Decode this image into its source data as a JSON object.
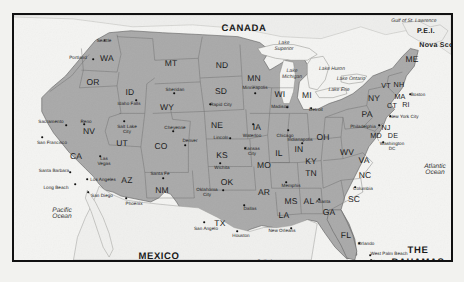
{
  "figure": {
    "frame_color": "#111111",
    "land_color": "#a9a9a9",
    "water_color": "#f4f4f2",
    "page_background": "#f2f2ef"
  },
  "countries": [
    {
      "name": "CANADA",
      "x": 230,
      "y": 13
    },
    {
      "name": "MEXICO",
      "x": 145,
      "y": 241
    },
    {
      "name": "THE",
      "x": 404,
      "y": 235
    },
    {
      "name": "BAHAMAS",
      "x": 404,
      "y": 247
    }
  ],
  "regions": [
    {
      "name": "P.E.I.",
      "x": 412,
      "y": 16
    },
    {
      "name": "Nova Scotia",
      "x": 427,
      "y": 30
    }
  ],
  "waters": [
    {
      "name": "Gulf of St. Lawrence",
      "x": 400,
      "y": 7,
      "style": "italic"
    },
    {
      "name": "Lake Superior",
      "x": 270,
      "y": 32,
      "style": "italic",
      "lines": [
        "Lake",
        "Superior"
      ]
    },
    {
      "name": "Lake Michigan",
      "x": 278,
      "y": 60,
      "style": "italic",
      "lines": [
        "Lake",
        "Michigan"
      ]
    },
    {
      "name": "Lake Huron",
      "x": 318,
      "y": 55,
      "style": "italic"
    },
    {
      "name": "Lake Ontario",
      "x": 337,
      "y": 65,
      "style": "italic"
    },
    {
      "name": "Lake Erie",
      "x": 325,
      "y": 76,
      "style": "italic"
    },
    {
      "name": "Atlantic Ocean",
      "x": 421,
      "y": 155,
      "style": "italic",
      "lines": [
        "Atlantic",
        "Ocean"
      ]
    },
    {
      "name": "Pacific Ocean",
      "x": 48,
      "y": 199,
      "style": "italic",
      "lines": [
        "Pacific",
        "Ocean"
      ]
    },
    {
      "name": "Gulf of Mexico",
      "x": 250,
      "y": 251,
      "style": "italic",
      "lines": [
        "Gulf of",
        "Mexico"
      ]
    }
  ],
  "states": [
    {
      "abbr": "WA",
      "x": 93,
      "y": 43
    },
    {
      "abbr": "OR",
      "x": 79,
      "y": 67
    },
    {
      "abbr": "ID",
      "x": 116,
      "y": 77
    },
    {
      "abbr": "MT",
      "x": 157,
      "y": 48
    },
    {
      "abbr": "ND",
      "x": 208,
      "y": 50
    },
    {
      "abbr": "SD",
      "x": 207,
      "y": 76
    },
    {
      "abbr": "WY",
      "x": 153,
      "y": 92
    },
    {
      "abbr": "NV",
      "x": 75,
      "y": 116
    },
    {
      "abbr": "UT",
      "x": 108,
      "y": 128
    },
    {
      "abbr": "CO",
      "x": 147,
      "y": 131
    },
    {
      "abbr": "NE",
      "x": 203,
      "y": 110
    },
    {
      "abbr": "KS",
      "x": 208,
      "y": 140
    },
    {
      "abbr": "IA",
      "x": 243,
      "y": 112
    },
    {
      "abbr": "MN",
      "x": 240,
      "y": 63
    },
    {
      "abbr": "WI",
      "x": 266,
      "y": 79
    },
    {
      "abbr": "MI",
      "x": 293,
      "y": 80
    },
    {
      "abbr": "IL",
      "x": 265,
      "y": 138
    },
    {
      "abbr": "IN",
      "x": 285,
      "y": 134
    },
    {
      "abbr": "OH",
      "x": 309,
      "y": 122
    },
    {
      "abbr": "MO",
      "x": 250,
      "y": 150
    },
    {
      "abbr": "OK",
      "x": 213,
      "y": 167
    },
    {
      "abbr": "AR",
      "x": 250,
      "y": 177
    },
    {
      "abbr": "NM",
      "x": 148,
      "y": 175
    },
    {
      "abbr": "AZ",
      "x": 113,
      "y": 165
    },
    {
      "abbr": "CA",
      "x": 62,
      "y": 141
    },
    {
      "abbr": "TX",
      "x": 206,
      "y": 208
    },
    {
      "abbr": "LA",
      "x": 270,
      "y": 200
    },
    {
      "abbr": "MS",
      "x": 277,
      "y": 186
    },
    {
      "abbr": "AL",
      "x": 295,
      "y": 186
    },
    {
      "abbr": "GA",
      "x": 315,
      "y": 197
    },
    {
      "abbr": "FL",
      "x": 332,
      "y": 220
    },
    {
      "abbr": "TN",
      "x": 297,
      "y": 158
    },
    {
      "abbr": "KY",
      "x": 297,
      "y": 146
    },
    {
      "abbr": "WV",
      "x": 333,
      "y": 137
    },
    {
      "abbr": "VA",
      "x": 350,
      "y": 145
    },
    {
      "abbr": "NC",
      "x": 351,
      "y": 160
    },
    {
      "abbr": "SC",
      "x": 340,
      "y": 184
    },
    {
      "abbr": "PA",
      "x": 353,
      "y": 99
    },
    {
      "abbr": "NY",
      "x": 360,
      "y": 83
    },
    {
      "abbr": "ME",
      "x": 398,
      "y": 44
    },
    {
      "abbr": "VT",
      "x": 372,
      "y": 70
    },
    {
      "abbr": "NH",
      "x": 385,
      "y": 69
    },
    {
      "abbr": "MA",
      "x": 386,
      "y": 81
    },
    {
      "abbr": "CT",
      "x": 378,
      "y": 90
    },
    {
      "abbr": "RI",
      "x": 392,
      "y": 89
    },
    {
      "abbr": "NJ",
      "x": 372,
      "y": 112
    },
    {
      "abbr": "MD",
      "x": 362,
      "y": 120
    },
    {
      "abbr": "DE",
      "x": 379,
      "y": 120
    }
  ],
  "cities": [
    {
      "name": "Seattle",
      "x": 90,
      "y": 25,
      "dx": 90.5,
      "dy": 25
    },
    {
      "name": "Portland",
      "x": 64,
      "y": 42,
      "dx": 79,
      "dy": 44
    },
    {
      "name": "Sacramento",
      "x": 37,
      "y": 106,
      "dx": 52,
      "dy": 110
    },
    {
      "name": "San Francisco",
      "x": 38,
      "y": 127,
      "dx": 28,
      "dy": 122
    },
    {
      "name": "Reno",
      "x": 72,
      "y": 106,
      "dx": 70,
      "dy": 109
    },
    {
      "name": "Santa Barbara",
      "x": 40,
      "y": 155,
      "dx": 56,
      "dy": 157
    },
    {
      "name": "Los Angeles",
      "x": 89,
      "y": 164,
      "dx": 73,
      "dy": 164
    },
    {
      "name": "Long Beach",
      "x": 42,
      "y": 172,
      "dx": 61,
      "dy": 169
    },
    {
      "name": "San Diego",
      "x": 88,
      "y": 180,
      "dx": 74,
      "dy": 177
    },
    {
      "name": "Las Vegas",
      "x": 90,
      "y": 146,
      "dx": 86,
      "dy": 141,
      "lines": [
        "Las",
        "Vegas"
      ]
    },
    {
      "name": "Phoenix",
      "x": 120,
      "y": 188,
      "dx": 112,
      "dy": 183
    },
    {
      "name": "Salt Lake City",
      "x": 113,
      "y": 114,
      "dx": 110,
      "dy": 106,
      "lines": [
        "Salt Lake",
        "City"
      ]
    },
    {
      "name": "Idaho Falls",
      "x": 115,
      "y": 88,
      "dx": 122,
      "dy": 85
    },
    {
      "name": "Sheridan",
      "x": 161,
      "y": 74,
      "dx": 160,
      "dy": 78
    },
    {
      "name": "Rapid City",
      "x": 207,
      "y": 89,
      "dx": 196,
      "dy": 89
    },
    {
      "name": "Cheyenne",
      "x": 161,
      "y": 112,
      "dx": 159,
      "dy": 116
    },
    {
      "name": "Denver",
      "x": 176,
      "y": 125,
      "dx": 171,
      "dy": 130
    },
    {
      "name": "Santa Fe",
      "x": 146,
      "y": 158,
      "dx": 149,
      "dy": 163
    },
    {
      "name": "Lincoln",
      "x": 207,
      "y": 122,
      "dx": 216,
      "dy": 123
    },
    {
      "name": "Wichita",
      "x": 208,
      "y": 152,
      "dx": 206,
      "dy": 148
    },
    {
      "name": "Kansas City",
      "x": 238,
      "y": 136,
      "dx": 231,
      "dy": 133,
      "lines": [
        "Kansas",
        "City"
      ]
    },
    {
      "name": "Oklahoma City",
      "x": 193,
      "y": 177,
      "dx": 209,
      "dy": 175,
      "lines": [
        "Oklahoma",
        "City"
      ]
    },
    {
      "name": "Dallas",
      "x": 236,
      "y": 193,
      "dx": 230,
      "dy": 190
    },
    {
      "name": "San Angelo",
      "x": 192,
      "y": 213,
      "dx": 190,
      "dy": 207
    },
    {
      "name": "Houston",
      "x": 227,
      "y": 220,
      "dx": 223,
      "dy": 216
    },
    {
      "name": "New Orleans",
      "x": 268,
      "y": 215,
      "dx": 277,
      "dy": 213
    },
    {
      "name": "Memphis",
      "x": 277,
      "y": 170,
      "dx": 272,
      "dy": 167
    },
    {
      "name": "Atlanta",
      "x": 309,
      "y": 186,
      "dx": 305,
      "dy": 184
    },
    {
      "name": "Orlando",
      "x": 352,
      "y": 228,
      "dx": 345,
      "dy": 228
    },
    {
      "name": "West Palm Beach",
      "x": 375,
      "y": 238,
      "dx": 356,
      "dy": 240
    },
    {
      "name": "Miami",
      "x": 362,
      "y": 246,
      "dx": 357,
      "dy": 245
    },
    {
      "name": "Key West",
      "x": 355,
      "y": 258,
      "dx": 350,
      "dy": 258
    },
    {
      "name": "Columbia",
      "x": 349,
      "y": 173,
      "dx": 341,
      "dy": 172
    },
    {
      "name": "Minneapolis",
      "x": 241,
      "y": 72,
      "dx": 241,
      "dy": 78
    },
    {
      "name": "Madison",
      "x": 266,
      "y": 91,
      "dx": 273,
      "dy": 92
    },
    {
      "name": "Waterloo",
      "x": 238,
      "y": 120,
      "dx": 239,
      "dy": 109
    },
    {
      "name": "Chicago",
      "x": 271,
      "y": 120,
      "dx": 274,
      "dy": 115
    },
    {
      "name": "Indianapolis",
      "x": 286,
      "y": 124,
      "dx": 288,
      "dy": 128
    },
    {
      "name": "Detroit",
      "x": 302,
      "y": 94,
      "dx": 297,
      "dy": 93
    },
    {
      "name": "Philadelphia",
      "x": 349,
      "y": 111,
      "dx": 365,
      "dy": 110
    },
    {
      "name": "New York City",
      "x": 390,
      "y": 101,
      "dx": 376,
      "dy": 101
    },
    {
      "name": "Boston",
      "x": 404,
      "y": 79,
      "dx": 396,
      "dy": 79
    },
    {
      "name": "Washington DC",
      "x": 378,
      "y": 131,
      "dx": 369,
      "dy": 127,
      "lines": [
        "Washington",
        "DC"
      ]
    }
  ]
}
